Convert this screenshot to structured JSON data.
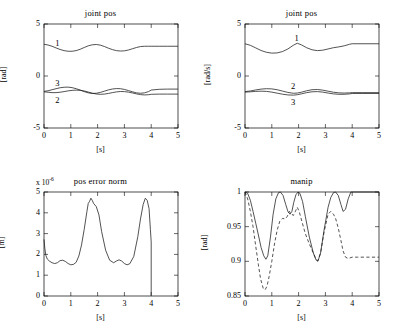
{
  "figure": {
    "background": "#ffffff",
    "line_color": "#1a1a1a",
    "axis_color": "#000000"
  },
  "chart_data": [
    {
      "id": "joint-pos-top-left",
      "type": "line",
      "title": "joint pos",
      "xlabel": "[s]",
      "ylabel": "[rad]",
      "xlim": [
        0,
        5
      ],
      "ylim": [
        -5,
        5
      ],
      "xticks": [
        0,
        1,
        2,
        3,
        4,
        5
      ],
      "xticklabels": [
        "0",
        "1",
        "2",
        "3",
        "4",
        "5"
      ],
      "yticks": [
        -5,
        0,
        5
      ],
      "yticklabels": [
        "-5",
        "0",
        "5"
      ],
      "grid": false,
      "legend": "inline-curve-labels",
      "annotations": [
        {
          "text": "1",
          "x": 0.42,
          "y": 3.05
        },
        {
          "text": "3",
          "x": 0.42,
          "y": -0.75
        },
        {
          "text": "2",
          "x": 0.42,
          "y": -2.45
        },
        {
          "text": "",
          "x": 0,
          "y": 0
        }
      ],
      "series": [
        {
          "name": "1",
          "style": "solid",
          "x": [
            0.0,
            0.15,
            0.3,
            0.45,
            0.6,
            0.75,
            0.9,
            1.05,
            1.2,
            1.35,
            1.5,
            1.65,
            1.8,
            1.95,
            2.1,
            2.25,
            2.4,
            2.55,
            2.7,
            2.85,
            3.0,
            3.15,
            3.3,
            3.45,
            3.6,
            3.75,
            3.9,
            4.0,
            4.3,
            4.6,
            5.0
          ],
          "y": [
            3.05,
            2.98,
            2.86,
            2.7,
            2.55,
            2.44,
            2.38,
            2.38,
            2.44,
            2.57,
            2.74,
            2.9,
            3.0,
            3.03,
            2.97,
            2.84,
            2.68,
            2.54,
            2.44,
            2.4,
            2.42,
            2.5,
            2.62,
            2.74,
            2.83,
            2.86,
            2.86,
            2.86,
            2.86,
            2.86,
            2.86
          ]
        },
        {
          "name": "3",
          "style": "solid",
          "x": [
            0.0,
            0.15,
            0.3,
            0.45,
            0.6,
            0.75,
            0.9,
            1.05,
            1.2,
            1.35,
            1.5,
            1.65,
            1.8,
            1.95,
            2.1,
            2.25,
            2.4,
            2.55,
            2.7,
            2.85,
            3.0,
            3.15,
            3.3,
            3.45,
            3.6,
            3.75,
            3.9,
            4.0,
            4.3,
            4.6,
            5.0
          ],
          "y": [
            -1.48,
            -1.42,
            -1.32,
            -1.22,
            -1.13,
            -1.08,
            -1.07,
            -1.12,
            -1.22,
            -1.35,
            -1.5,
            -1.62,
            -1.68,
            -1.66,
            -1.58,
            -1.46,
            -1.34,
            -1.25,
            -1.21,
            -1.22,
            -1.29,
            -1.4,
            -1.52,
            -1.62,
            -1.66,
            -1.62,
            -1.5,
            -1.35,
            -1.28,
            -1.26,
            -1.26
          ]
        },
        {
          "name": "2",
          "style": "solid",
          "x": [
            0.0,
            0.15,
            0.3,
            0.45,
            0.6,
            0.75,
            0.9,
            1.05,
            1.2,
            1.35,
            1.5,
            1.65,
            1.8,
            1.95,
            2.1,
            2.25,
            2.4,
            2.55,
            2.7,
            2.85,
            3.0,
            3.15,
            3.3,
            3.45,
            3.6,
            3.75,
            3.9,
            4.0,
            4.3,
            4.6,
            5.0
          ],
          "y": [
            -1.52,
            -1.56,
            -1.6,
            -1.6,
            -1.56,
            -1.5,
            -1.43,
            -1.38,
            -1.36,
            -1.38,
            -1.44,
            -1.54,
            -1.65,
            -1.73,
            -1.76,
            -1.74,
            -1.68,
            -1.6,
            -1.53,
            -1.49,
            -1.5,
            -1.55,
            -1.63,
            -1.72,
            -1.79,
            -1.82,
            -1.8,
            -1.76,
            -1.74,
            -1.74,
            -1.74
          ]
        }
      ]
    },
    {
      "id": "joint-pos-top-right",
      "type": "line",
      "title": "joint pos",
      "xlabel": "[s]",
      "ylabel": "[rad/s]",
      "xlim": [
        0,
        5
      ],
      "ylim": [
        -5,
        5
      ],
      "xticks": [
        0,
        1,
        2,
        3,
        4,
        5
      ],
      "xticklabels": [
        "0",
        "1",
        "2",
        "3",
        "4",
        "5"
      ],
      "yticks": [
        -5,
        0,
        5
      ],
      "yticklabels": [
        "-5",
        "0",
        "5"
      ],
      "grid": false,
      "legend": "inline-curve-labels",
      "annotations": [
        {
          "text": "1",
          "x": 1.85,
          "y": 3.55
        },
        {
          "text": "2",
          "x": 1.72,
          "y": -1.05
        },
        {
          "text": "3",
          "x": 1.72,
          "y": -2.55
        }
      ],
      "series": [
        {
          "name": "1",
          "style": "solid",
          "x": [
            0.0,
            0.2,
            0.4,
            0.6,
            0.8,
            1.0,
            1.2,
            1.4,
            1.6,
            1.8,
            1.95,
            2.1,
            2.3,
            2.5,
            2.7,
            2.9,
            3.1,
            3.3,
            3.5,
            3.7,
            3.9,
            4.0,
            4.4,
            5.0
          ],
          "y": [
            3.1,
            2.95,
            2.7,
            2.45,
            2.28,
            2.2,
            2.22,
            2.35,
            2.6,
            2.95,
            3.15,
            3.0,
            2.72,
            2.52,
            2.44,
            2.48,
            2.6,
            2.72,
            2.8,
            2.9,
            3.05,
            3.1,
            3.1,
            3.1
          ]
        },
        {
          "name": "2",
          "style": "solid",
          "x": [
            0.0,
            0.2,
            0.4,
            0.6,
            0.8,
            1.0,
            1.2,
            1.4,
            1.6,
            1.8,
            1.95,
            2.1,
            2.3,
            2.5,
            2.7,
            2.9,
            3.1,
            3.3,
            3.5,
            3.7,
            3.9,
            4.0,
            4.4,
            5.0
          ],
          "y": [
            -1.5,
            -1.44,
            -1.34,
            -1.26,
            -1.22,
            -1.24,
            -1.32,
            -1.45,
            -1.58,
            -1.66,
            -1.64,
            -1.56,
            -1.42,
            -1.32,
            -1.3,
            -1.36,
            -1.46,
            -1.56,
            -1.62,
            -1.64,
            -1.62,
            -1.6,
            -1.6,
            -1.6
          ]
        },
        {
          "name": "3",
          "style": "solid",
          "x": [
            0.0,
            0.2,
            0.4,
            0.6,
            0.8,
            1.0,
            1.2,
            1.4,
            1.6,
            1.8,
            1.95,
            2.1,
            2.3,
            2.5,
            2.7,
            2.9,
            3.1,
            3.3,
            3.5,
            3.7,
            3.9,
            4.0,
            4.4,
            5.0
          ],
          "y": [
            -1.55,
            -1.52,
            -1.48,
            -1.46,
            -1.48,
            -1.55,
            -1.65,
            -1.75,
            -1.82,
            -1.84,
            -1.8,
            -1.72,
            -1.6,
            -1.52,
            -1.5,
            -1.55,
            -1.64,
            -1.72,
            -1.76,
            -1.76,
            -1.72,
            -1.68,
            -1.68,
            -1.68
          ]
        }
      ]
    },
    {
      "id": "pos-error-norm-bottom-left",
      "type": "line",
      "title": "pos error norm",
      "xlabel": "[s]",
      "ylabel": "[m]",
      "exponent_label": "x 10",
      "exponent_value": "-6",
      "xlim": [
        0,
        5
      ],
      "ylim": [
        0,
        5
      ],
      "xticks": [
        0,
        1,
        2,
        3,
        4,
        5
      ],
      "xticklabels": [
        "0",
        "1",
        "2",
        "3",
        "4",
        "5"
      ],
      "yticks": [
        0,
        1,
        2,
        3,
        4,
        5
      ],
      "yticklabels": [
        "0",
        "1",
        "2",
        "3",
        "4",
        "5"
      ],
      "grid": false,
      "legend": "none",
      "series": [
        {
          "name": "pos error norm",
          "style": "solid",
          "x": [
            0.0,
            0.03,
            0.07,
            0.12,
            0.2,
            0.3,
            0.4,
            0.5,
            0.6,
            0.7,
            0.8,
            0.9,
            1.0,
            1.1,
            1.2,
            1.3,
            1.4,
            1.5,
            1.6,
            1.65,
            1.7,
            1.75,
            1.8,
            1.85,
            1.95,
            2.05,
            2.15,
            2.3,
            2.45,
            2.6,
            2.7,
            2.8,
            2.9,
            3.0,
            3.1,
            3.2,
            3.35,
            3.5,
            3.6,
            3.7,
            3.78,
            3.85,
            3.92,
            3.97,
            4.0,
            4.0
          ],
          "y": [
            2.72,
            2.3,
            1.95,
            1.78,
            1.68,
            1.6,
            1.56,
            1.6,
            1.7,
            1.72,
            1.66,
            1.56,
            1.5,
            1.52,
            1.62,
            1.92,
            2.45,
            3.2,
            4.05,
            4.45,
            4.55,
            4.7,
            4.6,
            4.45,
            4.3,
            3.9,
            3.1,
            2.2,
            1.72,
            1.6,
            1.68,
            1.74,
            1.68,
            1.56,
            1.5,
            1.55,
            1.9,
            2.85,
            3.7,
            4.4,
            4.7,
            4.6,
            4.2,
            3.2,
            2.6,
            0.02
          ]
        }
      ]
    },
    {
      "id": "manip-bottom-right",
      "type": "line",
      "title": "manip",
      "xlabel": "[s]",
      "ylabel": "[rad]",
      "xlim": [
        0,
        5
      ],
      "ylim": [
        0.85,
        1.0
      ],
      "xticks": [
        0,
        1,
        2,
        3,
        4,
        5
      ],
      "xticklabels": [
        "0",
        "1",
        "2",
        "3",
        "4",
        "5"
      ],
      "yticks": [
        0.85,
        0.9,
        0.95,
        1.0
      ],
      "yticklabels": [
        "0.85",
        "0.9",
        "0.95",
        "1"
      ],
      "grid": false,
      "legend": "none",
      "series": [
        {
          "name": "manip-solid",
          "style": "solid",
          "x": [
            0.0,
            0.1,
            0.2,
            0.3,
            0.4,
            0.5,
            0.6,
            0.7,
            0.78,
            0.85,
            0.95,
            1.05,
            1.15,
            1.25,
            1.32,
            1.42,
            1.52,
            1.6,
            1.68,
            1.75,
            1.82,
            1.9,
            1.98,
            2.05,
            2.15,
            2.25,
            2.4,
            2.55,
            2.65,
            2.72,
            2.82,
            2.95,
            3.1,
            3.2,
            3.3,
            3.38,
            3.48,
            3.58,
            3.66,
            3.75,
            3.85,
            3.95,
            4.05,
            4.2,
            4.5,
            5.0
          ],
          "y": [
            1.0,
            0.998,
            0.988,
            0.972,
            0.955,
            0.938,
            0.92,
            0.908,
            0.903,
            0.908,
            0.935,
            0.968,
            0.99,
            0.999,
            1.0,
            0.995,
            0.982,
            0.972,
            0.968,
            0.972,
            0.985,
            0.996,
            1.0,
            0.998,
            0.986,
            0.965,
            0.935,
            0.912,
            0.902,
            0.9,
            0.912,
            0.945,
            0.978,
            0.992,
            0.999,
            1.0,
            0.995,
            0.982,
            0.972,
            0.975,
            0.99,
            1.0,
            1.0,
            1.0,
            1.0,
            1.0
          ]
        },
        {
          "name": "manip-dashed",
          "style": "dashed",
          "x": [
            0.0,
            0.1,
            0.2,
            0.3,
            0.4,
            0.5,
            0.58,
            0.68,
            0.75,
            0.82,
            0.9,
            1.0,
            1.1,
            1.2,
            1.3,
            1.4,
            1.5,
            1.58,
            1.65,
            1.72,
            1.8,
            1.88,
            1.95,
            2.02,
            2.12,
            2.25,
            2.4,
            2.55,
            2.65,
            2.72,
            2.82,
            2.95,
            3.1,
            3.2,
            3.3,
            3.38,
            3.48,
            3.58,
            3.66,
            3.75,
            3.85,
            3.92,
            4.0,
            4.2,
            4.5,
            5.0
          ],
          "y": [
            1.0,
            0.99,
            0.972,
            0.95,
            0.922,
            0.895,
            0.875,
            0.861,
            0.859,
            0.864,
            0.878,
            0.9,
            0.925,
            0.945,
            0.958,
            0.962,
            0.961,
            0.965,
            0.972,
            0.97,
            0.966,
            0.972,
            0.978,
            0.972,
            0.958,
            0.94,
            0.925,
            0.912,
            0.903,
            0.901,
            0.912,
            0.942,
            0.968,
            0.972,
            0.968,
            0.962,
            0.948,
            0.93,
            0.915,
            0.906,
            0.904,
            0.905,
            0.906,
            0.906,
            0.906,
            0.906
          ]
        }
      ]
    }
  ]
}
